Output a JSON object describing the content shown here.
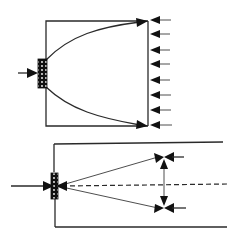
{
  "figure": {
    "top_panel": {
      "description": "Source emitting diverging rays across a rectangular region toward a boundary with incoming arrows",
      "incoming_arrow_count": 8,
      "incoming_arrow_ys": [
        20,
        34,
        50,
        64,
        80,
        95,
        110,
        125
      ],
      "source_pattern": "dotted-block"
    },
    "bottom_panel": {
      "description": "Source on axis with two converging rays to a pair of opposing arrow heads separated by a vertical double arrow",
      "axis_style": "dashed",
      "source_pattern": "dotted-block"
    }
  },
  "colors": {
    "ink": "#111111",
    "line": "#2a2a2a",
    "background": "#ffffff"
  }
}
